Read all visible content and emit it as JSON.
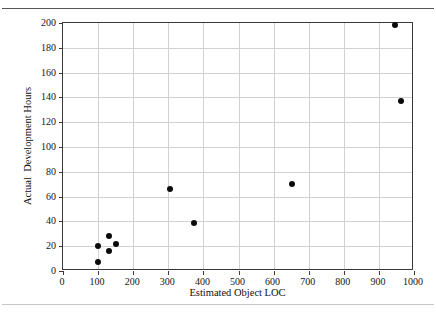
{
  "figure": {
    "top_rule_color": "#555555",
    "bottom_rule_color": "#c8c8c8",
    "frame_color": "#3a3a3a",
    "grid_color": "#d2d2d2",
    "marker_color": "#0b0b0b",
    "background": "#ffffff"
  },
  "chart_data": {
    "type": "scatter",
    "title": "",
    "xlabel": "Estimated Object LOC",
    "ylabel": "Actual  Development Hours",
    "xlim": [
      0,
      1000
    ],
    "ylim": [
      0,
      200
    ],
    "xticks": [
      0,
      100,
      200,
      300,
      400,
      500,
      600,
      700,
      800,
      900,
      1000
    ],
    "yticks": [
      0,
      20,
      40,
      60,
      80,
      100,
      120,
      140,
      160,
      180,
      200
    ],
    "xtick_labels": [
      "0",
      "100",
      "200",
      "300",
      "400",
      "500",
      "600",
      "700",
      "800",
      "900",
      "1000"
    ],
    "ytick_labels": [
      "0",
      "20",
      "40",
      "60",
      "80",
      "100",
      "120",
      "140",
      "160",
      "180",
      "200"
    ],
    "grid": true,
    "legend": false,
    "marker": "filled-circle",
    "series": [
      {
        "name": "projects",
        "points": [
          {
            "x": 100,
            "y": 7
          },
          {
            "x": 100,
            "y": 20
          },
          {
            "x": 130,
            "y": 16
          },
          {
            "x": 130,
            "y": 28
          },
          {
            "x": 152,
            "y": 22
          },
          {
            "x": 305,
            "y": 66
          },
          {
            "x": 372,
            "y": 39
          },
          {
            "x": 652,
            "y": 70
          },
          {
            "x": 945,
            "y": 198
          },
          {
            "x": 962,
            "y": 137
          }
        ]
      }
    ]
  }
}
